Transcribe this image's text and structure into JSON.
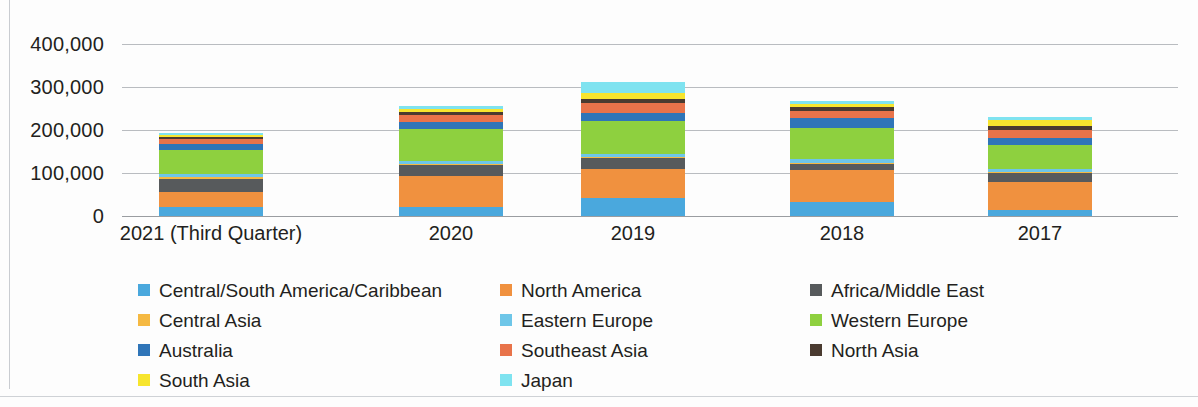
{
  "chart_data": {
    "type": "bar",
    "subtype": "stacked-vertical",
    "title": "",
    "xlabel": "",
    "ylabel": "",
    "ylim": [
      0,
      400000
    ],
    "y_ticks": [
      0,
      100000,
      200000,
      300000,
      400000
    ],
    "y_tick_labels": [
      "0",
      "100,000",
      "200,000",
      "300,000",
      "400,000"
    ],
    "grid": true,
    "legend_position": "bottom",
    "categories": [
      "2021 (Third Quarter)",
      "2020",
      "2019",
      "2018",
      "2017"
    ],
    "series": [
      {
        "name": "Central/South America/Caribbean",
        "color": "#4aa8dd",
        "values": [
          21000,
          22000,
          41000,
          33000,
          13000
        ]
      },
      {
        "name": "North America",
        "color": "#f0913f",
        "values": [
          35000,
          70000,
          68000,
          74000,
          65000
        ]
      },
      {
        "name": "Africa/Middle East",
        "color": "#575a5c",
        "values": [
          31000,
          27000,
          25000,
          14000,
          22000
        ]
      },
      {
        "name": "Central Asia",
        "color": "#f5b942",
        "values": [
          3000,
          3000,
          3000,
          3000,
          3000
        ]
      },
      {
        "name": "Eastern Europe",
        "color": "#6ec6e8",
        "values": [
          7000,
          7000,
          8000,
          9000,
          6000
        ]
      },
      {
        "name": "Western Europe",
        "color": "#8ed03f",
        "values": [
          56000,
          73000,
          75000,
          72000,
          57000
        ]
      },
      {
        "name": "Australia",
        "color": "#2f75b8",
        "values": [
          14000,
          17000,
          20000,
          22000,
          16000
        ]
      },
      {
        "name": "Southeast Asia",
        "color": "#e8734a",
        "values": [
          12000,
          15000,
          24000,
          18000,
          19000
        ]
      },
      {
        "name": "North Asia",
        "color": "#4a3b30",
        "values": [
          5000,
          7000,
          9000,
          8000,
          9000
        ]
      },
      {
        "name": "South Asia",
        "color": "#f7e52e",
        "values": [
          5000,
          9000,
          13000,
          8000,
          13000
        ]
      },
      {
        "name": "Japan",
        "color": "#7fe3f0",
        "values": [
          4000,
          5000,
          26000,
          7000,
          7000
        ]
      }
    ],
    "totals": [
      193000,
      255000,
      312000,
      268000,
      230000
    ]
  },
  "legend": {
    "rows": [
      [
        {
          "label": "Central/South America/Caribbean",
          "color": "#4aa8dd"
        },
        {
          "label": "North America",
          "color": "#f0913f"
        },
        {
          "label": "Africa/Middle East",
          "color": "#575a5c"
        }
      ],
      [
        {
          "label": "Central Asia",
          "color": "#f5b942"
        },
        {
          "label": "Eastern Europe",
          "color": "#6ec6e8"
        },
        {
          "label": "Western Europe",
          "color": "#8ed03f"
        }
      ],
      [
        {
          "label": "Australia",
          "color": "#2f75b8"
        },
        {
          "label": "Southeast Asia",
          "color": "#e8734a"
        },
        {
          "label": "North Asia",
          "color": "#4a3b30"
        }
      ],
      [
        {
          "label": "South Asia",
          "color": "#f7e52e"
        },
        {
          "label": "Japan",
          "color": "#7fe3f0"
        },
        {
          "label": "",
          "color": "transparent"
        }
      ]
    ]
  }
}
